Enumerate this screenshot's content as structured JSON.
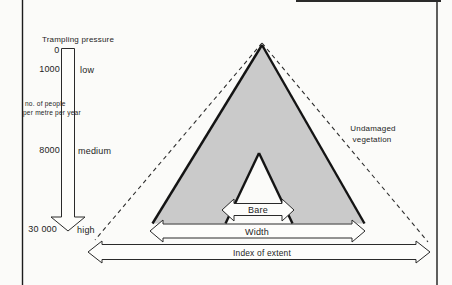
{
  "figure": {
    "pressure_scale": {
      "title": "Trampling pressure",
      "zero_label": "0",
      "tick_1000": "1000",
      "tick_8000": "8000",
      "tick_30000": "30 000",
      "level_low": "low",
      "level_medium": "medium",
      "level_high": "high",
      "unit_line1": "no. of people",
      "unit_line2": "per metre per year"
    },
    "triangle": {
      "undamaged_line1": "Undamaged",
      "undamaged_line2": "vegetation",
      "bare_label": "Bare",
      "width_label": "Width",
      "extent_label": "Index of extent"
    },
    "colors": {
      "damaged_fill": "#cacaca",
      "line": "#1e1e1e",
      "background": "#fbfbf9"
    }
  }
}
